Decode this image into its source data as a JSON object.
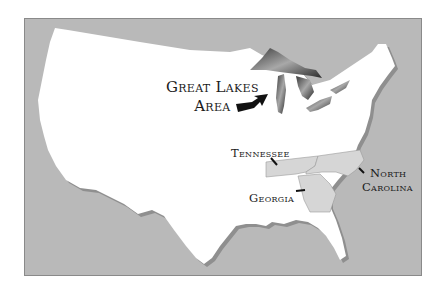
{
  "map": {
    "labels": {
      "great_lakes_line1": "Great Lakes",
      "great_lakes_line2": "Area",
      "tennessee": "Tennessee",
      "north_carolina_line1": "North",
      "north_carolina_line2": "Carolina",
      "georgia": "Georgia"
    },
    "colors": {
      "ocean": "#b9b9b9",
      "land": "#ffffff",
      "highlighted_states": "#d6d6d6",
      "lakes": "#6e6e6e"
    }
  }
}
